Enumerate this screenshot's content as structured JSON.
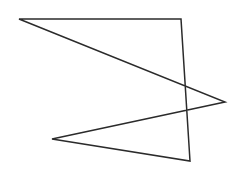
{
  "canvas": {
    "width": 240,
    "height": 170,
    "background": "#ffffff"
  },
  "shape": {
    "type": "self-intersecting-polygon",
    "stroke": "#2b2b2b",
    "stroke_width": 1.5,
    "points": [
      [
        19,
        19
      ],
      [
        181,
        19
      ],
      [
        190,
        161
      ],
      [
        52,
        139
      ],
      [
        225,
        102
      ]
    ],
    "points_attr": "19,19 181,19 190,161 52,139 225,102"
  }
}
